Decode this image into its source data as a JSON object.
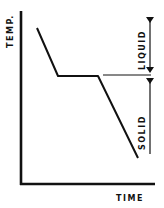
{
  "diagram": {
    "type": "cooling-curve",
    "axes": {
      "y_label": "TEMP.",
      "x_label": "TIME"
    },
    "regions": [
      {
        "label": "LIQUID",
        "position": "above-plateau"
      },
      {
        "label": "SOLID",
        "position": "below-plateau"
      }
    ],
    "curve_segments": [
      "cooling liquid",
      "plateau (freezing)",
      "cooling solid"
    ],
    "colors": {
      "ink": "#111111",
      "background": "#ffffff"
    }
  }
}
